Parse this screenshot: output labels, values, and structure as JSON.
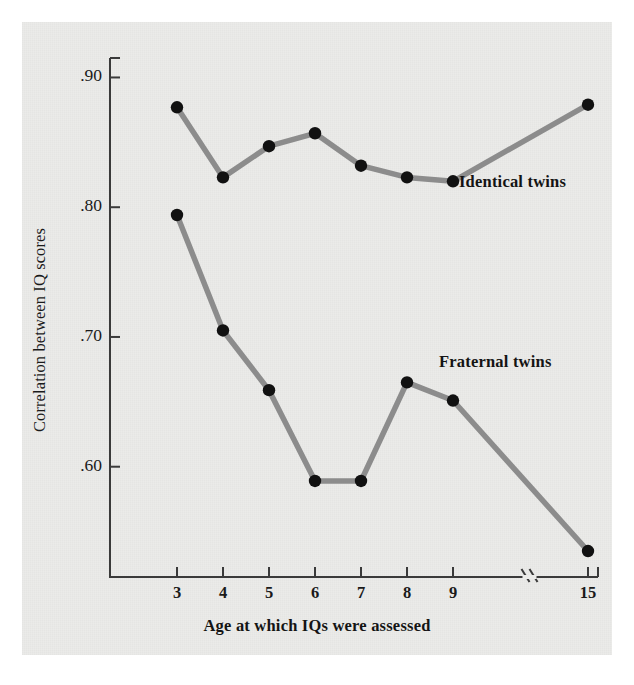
{
  "figure": {
    "background_color": "#ebebe9",
    "page_color": "#ffffff"
  },
  "chart_data": {
    "type": "line",
    "title": "",
    "xlabel": "Age at which IQs were assessed",
    "ylabel": "Correlation between IQ scores",
    "x": [
      3,
      4,
      5,
      6,
      7,
      8,
      9,
      15
    ],
    "xtick_labels": [
      "3",
      "4",
      "5",
      "6",
      "7",
      "8",
      "9",
      "15"
    ],
    "ytick_labels": [
      ".90",
      ".80",
      ".70",
      ".60"
    ],
    "ytick_values": [
      0.9,
      0.8,
      0.7,
      0.6
    ],
    "ylim": [
      0.515,
      0.915
    ],
    "axis_break": {
      "present": true,
      "between": [
        9,
        15
      ],
      "symbol": "//"
    },
    "grid": false,
    "legend_position": "inline-annotation",
    "line_color": "#8c8c8c",
    "marker_color": "#111111",
    "series": [
      {
        "name": "Identical twins",
        "label": "Identical twins",
        "values": [
          0.877,
          0.823,
          0.847,
          0.857,
          0.832,
          0.823,
          0.82,
          0.879
        ]
      },
      {
        "name": "Fraternal twins",
        "label": "Fraternal twins",
        "values": [
          0.794,
          0.705,
          0.659,
          0.589,
          0.589,
          0.665,
          0.651,
          0.535
        ]
      }
    ]
  }
}
